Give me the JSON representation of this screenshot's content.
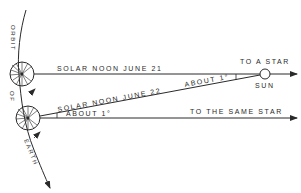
{
  "diagram": {
    "orbit_label_top": "ORBIT",
    "orbit_label_mid": "OF",
    "orbit_label_bottom": "EARTH",
    "line_june21_label": "SOLAR NOON JUNE 21",
    "line_june22_label": "SOLAR NOON JUNE 22",
    "star_label_top": "TO A STAR",
    "sun_label": "SUN",
    "angle_label_sun": "ABOUT 1°",
    "angle_label_earth": "ABOUT 1°",
    "star_label_bottom": "TO THE SAME STAR"
  },
  "colors": {
    "ink": "#2a2a2a",
    "background": "#ffffff"
  }
}
